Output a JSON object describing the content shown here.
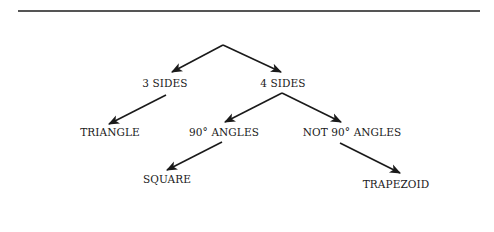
{
  "diagram": {
    "type": "decision-tree",
    "nodes": [
      {
        "id": "root",
        "label": "",
        "x": 223,
        "y": 45
      },
      {
        "id": "three_sides",
        "label": "3 SIDES",
        "x": 165,
        "y": 83
      },
      {
        "id": "four_sides",
        "label": "4 SIDES",
        "x": 283,
        "y": 83
      },
      {
        "id": "triangle",
        "label": "TRIANGLE",
        "x": 110,
        "y": 132
      },
      {
        "id": "ninety",
        "label": "90° ANGLES",
        "x": 224,
        "y": 132
      },
      {
        "id": "not_ninety",
        "label": "NOT 90° ANGLES",
        "x": 352,
        "y": 132
      },
      {
        "id": "square",
        "label": "SQUARE",
        "x": 167,
        "y": 179
      },
      {
        "id": "trapezoid",
        "label": "TRAPEZOID",
        "x": 396,
        "y": 184
      }
    ],
    "edges": [
      {
        "from": "root",
        "to": "three_sides"
      },
      {
        "from": "root",
        "to": "four_sides"
      },
      {
        "from": "three_sides",
        "to": "triangle"
      },
      {
        "from": "four_sides",
        "to": "ninety"
      },
      {
        "from": "four_sides",
        "to": "not_ninety"
      },
      {
        "from": "ninety",
        "to": "square"
      },
      {
        "from": "not_ninety",
        "to": "trapezoid"
      }
    ]
  },
  "labels": {
    "three_sides": "3 SIDES",
    "four_sides": "4 SIDES",
    "triangle": "TRIANGLE",
    "ninety": "90° ANGLES",
    "not_ninety": "NOT 90° ANGLES",
    "square": "SQUARE",
    "trapezoid": "TRAPEZOID"
  },
  "colors": {
    "line": "#1a1a1a",
    "text": "#1a1a1a",
    "rule": "#555555"
  }
}
